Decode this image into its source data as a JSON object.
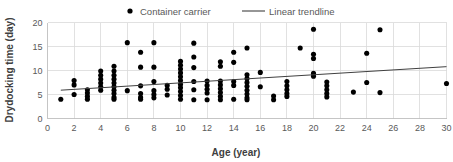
{
  "chart_data": {
    "type": "scatter",
    "title": "",
    "xlabel": "Age (year)",
    "ylabel": "Drydocking time (day)",
    "xlim": [
      0,
      30
    ],
    "ylim": [
      0,
      20
    ],
    "xticks": [
      0,
      2,
      4,
      6,
      8,
      10,
      12,
      14,
      16,
      18,
      20,
      22,
      24,
      26,
      28,
      30
    ],
    "yticks": [
      0,
      5,
      10,
      15,
      20
    ],
    "grid": true,
    "legend_position": "top",
    "legend": [
      {
        "label": "Container carrier",
        "marker": "dot",
        "color": "#000000"
      },
      {
        "label": "Linear trendline",
        "marker": "line",
        "color": "#404040"
      }
    ],
    "series": [
      {
        "name": "Container carrier",
        "marker": "dot",
        "color": "#000000",
        "points": [
          [
            1,
            4.0
          ],
          [
            2,
            7.9
          ],
          [
            2,
            7.0
          ],
          [
            2,
            5.0
          ],
          [
            3,
            6.0
          ],
          [
            3,
            5.3
          ],
          [
            3,
            4.6
          ],
          [
            3,
            4.0
          ],
          [
            4,
            9.9
          ],
          [
            4,
            9.0
          ],
          [
            4,
            8.2
          ],
          [
            4,
            7.4
          ],
          [
            4,
            6.6
          ],
          [
            4,
            5.9
          ],
          [
            5,
            10.9
          ],
          [
            5,
            9.9
          ],
          [
            5,
            9.0
          ],
          [
            5,
            8.2
          ],
          [
            5,
            7.4
          ],
          [
            5,
            6.6
          ],
          [
            5,
            5.9
          ],
          [
            5,
            5.2
          ],
          [
            5,
            4.4
          ],
          [
            5,
            4.0
          ],
          [
            6,
            15.8
          ],
          [
            6,
            5.8
          ],
          [
            7,
            13.8
          ],
          [
            7,
            10.7
          ],
          [
            7,
            6.8
          ],
          [
            7,
            5.2
          ],
          [
            7,
            4.4
          ],
          [
            7,
            4.0
          ],
          [
            8,
            15.8
          ],
          [
            8,
            10.7
          ],
          [
            8,
            7.7
          ],
          [
            8,
            5.8
          ],
          [
            8,
            5.0
          ],
          [
            8,
            4.3
          ],
          [
            9,
            6.9
          ],
          [
            9,
            6.1
          ],
          [
            9,
            4.9
          ],
          [
            10,
            11.9
          ],
          [
            10,
            11.1
          ],
          [
            10,
            10.3
          ],
          [
            10,
            9.5
          ],
          [
            10,
            8.7
          ],
          [
            10,
            7.9
          ],
          [
            10,
            7.1
          ],
          [
            10,
            6.4
          ],
          [
            10,
            5.6
          ],
          [
            10,
            4.8
          ],
          [
            10,
            4.0
          ],
          [
            11,
            15.7
          ],
          [
            11,
            12.8
          ],
          [
            11,
            10.6
          ],
          [
            11,
            7.7
          ],
          [
            11,
            6.0
          ],
          [
            11,
            3.9
          ],
          [
            12,
            7.8
          ],
          [
            12,
            6.9
          ],
          [
            12,
            6.1
          ],
          [
            12,
            5.3
          ],
          [
            12,
            3.9
          ],
          [
            13,
            11.8
          ],
          [
            13,
            10.9
          ],
          [
            13,
            7.8
          ],
          [
            13,
            7.0
          ],
          [
            13,
            6.2
          ],
          [
            13,
            5.4
          ],
          [
            13,
            4.6
          ],
          [
            13,
            3.9
          ],
          [
            14,
            13.8
          ],
          [
            14,
            11.7
          ],
          [
            14,
            7.7
          ],
          [
            14,
            6.9
          ],
          [
            14,
            4.0
          ],
          [
            15,
            14.7
          ],
          [
            15,
            9.1
          ],
          [
            15,
            8.3
          ],
          [
            15,
            7.5
          ],
          [
            15,
            6.7
          ],
          [
            15,
            5.9
          ],
          [
            15,
            5.1
          ],
          [
            15,
            4.3
          ],
          [
            15,
            3.9
          ],
          [
            16,
            9.6
          ],
          [
            16,
            6.6
          ],
          [
            17,
            4.7
          ],
          [
            17,
            3.9
          ],
          [
            18,
            7.7
          ],
          [
            18,
            6.8
          ],
          [
            18,
            6.0
          ],
          [
            18,
            5.2
          ],
          [
            18,
            4.6
          ],
          [
            19,
            14.7
          ],
          [
            20,
            18.6
          ],
          [
            20,
            13.4
          ],
          [
            20,
            12.5
          ],
          [
            20,
            9.4
          ],
          [
            20,
            8.8
          ],
          [
            21,
            7.6
          ],
          [
            21,
            6.8
          ],
          [
            21,
            6.0
          ],
          [
            21,
            5.2
          ],
          [
            21,
            4.5
          ],
          [
            23,
            5.5
          ],
          [
            24,
            13.6
          ],
          [
            24,
            7.5
          ],
          [
            25,
            18.5
          ],
          [
            25,
            5.4
          ],
          [
            30,
            7.3
          ]
        ]
      }
    ],
    "trendline": {
      "name": "Linear trendline",
      "color": "#404040",
      "x_start": 1,
      "x_end": 30,
      "y_start": 5.9,
      "y_end": 10.8
    }
  }
}
